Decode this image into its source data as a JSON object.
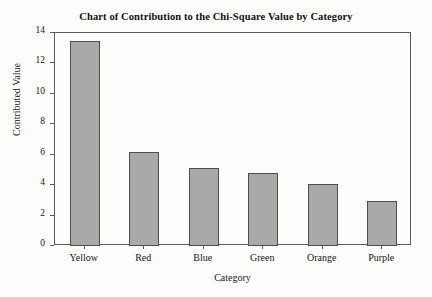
{
  "chart_data": {
    "type": "bar",
    "title": "Chart of Contribution to the Chi-Square Value by Category",
    "xlabel": "Category",
    "ylabel": "Contributed Value",
    "categories": [
      "Yellow",
      "Red",
      "Blue",
      "Green",
      "Orange",
      "Purple"
    ],
    "values": [
      13.45,
      6.15,
      5.15,
      4.8,
      4.05,
      2.95
    ],
    "ylim": [
      0,
      14
    ],
    "yticks": [
      0,
      2,
      4,
      6,
      8,
      10,
      12,
      14
    ],
    "ytick_labels": [
      "0",
      "2",
      "4",
      "6",
      "8",
      "10",
      "12",
      "14"
    ],
    "grid": false,
    "legend": "none",
    "bar_color": "#a9a9a9",
    "bar_edge_color": "#4e4e4e",
    "axis_color": "#5c5c5c",
    "background": "#fdfdfc"
  }
}
